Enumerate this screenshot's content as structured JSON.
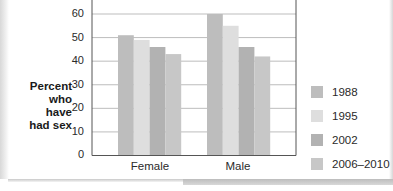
{
  "chart_data": {
    "type": "bar",
    "title": "",
    "xlabel": "",
    "ylabel": "Percent who have had sex",
    "ylabel_lines": [
      "Percent",
      "who have",
      "had sex"
    ],
    "ylim": [
      0,
      60
    ],
    "yticks": [
      0,
      10,
      20,
      30,
      40,
      50,
      60
    ],
    "grid": true,
    "legend_position": "right",
    "categories": [
      "Female",
      "Male"
    ],
    "series": [
      {
        "name": "1988",
        "values": [
          51,
          60
        ],
        "color": "#bdbdbd"
      },
      {
        "name": "1995",
        "values": [
          49,
          55
        ],
        "color": "#dedede"
      },
      {
        "name": "2002",
        "values": [
          46,
          46
        ],
        "color": "#b2b2b2"
      },
      {
        "name": "2006–2010",
        "values": [
          43,
          42
        ],
        "color": "#c7c7c7"
      }
    ]
  },
  "axis": {
    "ylabel": [
      "Percent",
      "who have",
      "had sex"
    ],
    "ticks": [
      "0",
      "10",
      "20",
      "30",
      "40",
      "50",
      "60"
    ],
    "categories": [
      "Female",
      "Male"
    ]
  },
  "legend": [
    {
      "label": "1988",
      "color": "#bdbdbd"
    },
    {
      "label": "1995",
      "color": "#dedede"
    },
    {
      "label": "2002",
      "color": "#b2b2b2"
    },
    {
      "label": "2006–2010",
      "color": "#c7c7c7"
    }
  ]
}
